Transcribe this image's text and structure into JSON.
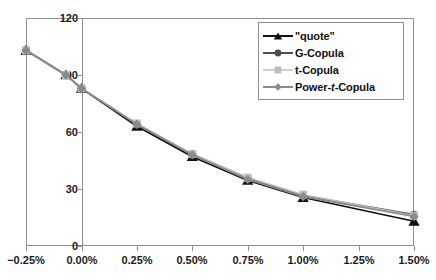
{
  "chart_data": {
    "type": "line",
    "title": "",
    "xlabel": "",
    "ylabel": "",
    "xlim": [
      -0.25,
      1.5
    ],
    "ylim": [
      0,
      120
    ],
    "yticks": [
      0,
      30,
      60,
      90,
      120
    ],
    "xticks": [
      "-0.25%",
      "0.00%",
      "0.25%",
      "0.50%",
      "0.75%",
      "1.00%",
      "1.25%",
      "1.50%"
    ],
    "x": [
      -0.25,
      -0.07,
      0.0,
      0.25,
      0.5,
      0.75,
      1.0,
      1.5
    ],
    "grid": false,
    "legend_position": "top-right",
    "series": [
      {
        "name": "\"quote\"",
        "marker": "triangle",
        "color": "#111111",
        "values": [
          103,
          90,
          83,
          63,
          47,
          34.5,
          25.5,
          13
        ]
      },
      {
        "name": "G-Copula",
        "marker": "circle",
        "color": "#4d4d4d",
        "values": [
          103,
          90,
          83,
          64,
          48,
          35.5,
          26.5,
          16.5
        ]
      },
      {
        "name": "t-Copula",
        "marker": "square",
        "color": "#bdbdbd",
        "values": [
          103,
          90,
          83,
          64.5,
          48.5,
          36,
          27,
          16
        ]
      },
      {
        "name": "Power-t-Copula",
        "marker": "diamond",
        "color": "#8a8a8a",
        "values": [
          103,
          90,
          83,
          64,
          48,
          35,
          26,
          15.5
        ]
      }
    ]
  },
  "axis": {
    "y_labels": [
      "120",
      "90",
      "60",
      "30",
      "0"
    ],
    "x_labels": [
      "−0.25%",
      "0.00%",
      "0.25%",
      "0.50%",
      "0.75%",
      "1.00%",
      "1.25%",
      "1.50%"
    ]
  },
  "legend": {
    "items": [
      {
        "label": "\"quote\"",
        "marker": "triangle-icon",
        "color": "#111111"
      },
      {
        "label": "G-Copula",
        "marker": "circle-icon",
        "color": "#4d4d4d"
      },
      {
        "label": "t-Copula",
        "marker": "square-icon",
        "color": "#bdbdbd"
      },
      {
        "label": "Power-t-Copula",
        "marker": "diamond-icon",
        "color": "#8a8a8a"
      }
    ]
  },
  "colors": {
    "axis": "#8f8f8f",
    "text": "#1a1a1a",
    "background": "#ffffff"
  },
  "caption_remnant": ""
}
